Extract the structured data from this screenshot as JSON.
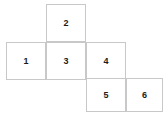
{
  "figure": {
    "background_color": "#ffffff",
    "border_color": "#c8c8c8",
    "label_color": "#1a1a1a",
    "cells": [
      {
        "label": "2",
        "row": 1,
        "col": 2
      },
      {
        "label": "1",
        "row": 2,
        "col": 1
      },
      {
        "label": "3",
        "row": 2,
        "col": 2
      },
      {
        "label": "4",
        "row": 2,
        "col": 3
      },
      {
        "label": "5",
        "row": 3,
        "col": 3
      },
      {
        "label": "6",
        "row": 3,
        "col": 4
      }
    ]
  }
}
